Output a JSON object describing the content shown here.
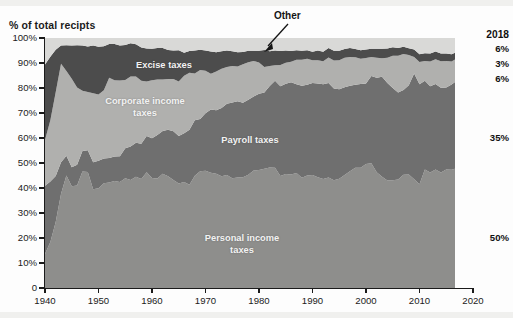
{
  "axis": {
    "ylabel": "% of total recipts",
    "yticks": [
      "0",
      "10%",
      "20%",
      "30%",
      "40%",
      "50%",
      "60%",
      "70%",
      "80%",
      "90%",
      "100%"
    ],
    "xticks": [
      "1940",
      "1950",
      "1960",
      "1970",
      "1980",
      "1990",
      "2000",
      "2010",
      "2020"
    ]
  },
  "annotations": {
    "other_label": "Other",
    "end_year": "2018",
    "end_other": "6%",
    "end_excise": "3%",
    "end_corporate": "6%",
    "end_payroll": "35%",
    "end_personal": "50%"
  },
  "series_labels": {
    "excise": "Excise taxes",
    "corporate_line1": "Corporate income",
    "corporate_line2": "taxes",
    "payroll": "Payroll taxes",
    "personal_line1": "Personal income",
    "personal_line2": "taxes"
  },
  "colors": {
    "other": "#d9d9d7",
    "excise": "#4c4c4c",
    "corporate": "#b0b0ae",
    "payroll": "#6f6f6f",
    "personal": "#8e8e8c",
    "axis": "#1b1b1b",
    "background": "#fdfdfd"
  },
  "chart_data": {
    "type": "area",
    "title": "",
    "subtitle": "",
    "xlabel": "",
    "ylabel": "% of total recipts",
    "stacked": true,
    "normalized": true,
    "grid": false,
    "legend": "in-plot labels",
    "xlim": [
      1940,
      2020
    ],
    "ylim": [
      0,
      100
    ],
    "data_end_year": 2018,
    "x": [
      1940,
      1941,
      1942,
      1943,
      1944,
      1945,
      1946,
      1947,
      1948,
      1949,
      1950,
      1951,
      1952,
      1953,
      1954,
      1955,
      1956,
      1957,
      1958,
      1959,
      1960,
      1961,
      1962,
      1963,
      1964,
      1965,
      1966,
      1967,
      1968,
      1969,
      1970,
      1971,
      1972,
      1973,
      1974,
      1975,
      1976,
      1977,
      1978,
      1979,
      1980,
      1981,
      1982,
      1983,
      1984,
      1985,
      1986,
      1987,
      1988,
      1989,
      1990,
      1991,
      1992,
      1993,
      1994,
      1995,
      1996,
      1997,
      1998,
      1999,
      2000,
      2001,
      2002,
      2003,
      2004,
      2005,
      2006,
      2007,
      2008,
      2009,
      2010,
      2011,
      2012,
      2013,
      2014,
      2015,
      2016,
      2017,
      2018
    ],
    "series": [
      {
        "name": "Personal income taxes",
        "color": "#8e8e8c",
        "values": [
          13.6,
          18.4,
          26.4,
          37.7,
          45.0,
          40.7,
          41.0,
          46.6,
          46.4,
          39.5,
          39.9,
          41.9,
          42.2,
          42.8,
          42.4,
          43.9,
          43.2,
          44.5,
          43.6,
          46.3,
          44.0,
          43.8,
          45.7,
          44.7,
          43.2,
          41.8,
          42.4,
          41.3,
          44.9,
          46.7,
          46.9,
          46.1,
          45.7,
          44.7,
          45.2,
          43.9,
          44.2,
          44.3,
          45.3,
          47.0,
          47.2,
          47.7,
          48.2,
          48.1,
          44.8,
          45.6,
          45.4,
          46.0,
          44.1,
          45.0,
          45.2,
          44.3,
          43.6,
          44.2,
          43.1,
          43.7,
          45.2,
          46.7,
          48.1,
          48.1,
          49.6,
          49.9,
          46.3,
          44.5,
          43.0,
          43.1,
          43.4,
          45.3,
          45.4,
          43.5,
          41.5,
          47.4,
          46.2,
          47.4,
          46.2,
          47.4,
          47.3,
          47.9,
          50.0
        ],
        "end_value": 50
      },
      {
        "name": "Payroll taxes",
        "color": "#6f6f6f",
        "values": [
          27.3,
          24.2,
          18.4,
          12.6,
          7.9,
          7.6,
          8.3,
          8.2,
          8.7,
          10.8,
          11.0,
          9.9,
          9.8,
          9.8,
          10.3,
          12.0,
          13.4,
          13.6,
          14.1,
          14.5,
          15.9,
          17.4,
          17.1,
          18.6,
          19.5,
          19.0,
          19.5,
          22.0,
          22.2,
          20.9,
          23.0,
          25.3,
          25.4,
          27.3,
          28.5,
          30.3,
          30.5,
          29.8,
          30.0,
          29.6,
          30.5,
          30.5,
          32.6,
          34.8,
          35.9,
          36.1,
          36.9,
          35.5,
          36.8,
          36.3,
          36.8,
          37.5,
          37.9,
          37.8,
          36.7,
          35.8,
          35.1,
          34.2,
          33.2,
          33.5,
          32.2,
          34.9,
          37.8,
          40.0,
          39.0,
          36.9,
          34.8,
          33.9,
          35.7,
          42.3,
          40.0,
          35.5,
          34.5,
          34.2,
          33.9,
          32.8,
          34.1,
          35.0,
          35.0
        ],
        "end_value": 35
      },
      {
        "name": "Corporate income taxes",
        "color": "#b0b0ae",
        "values": [
          18.3,
          24.5,
          33.5,
          39.4,
          33.9,
          35.4,
          30.9,
          24.1,
          23.3,
          27.6,
          26.5,
          27.3,
          32.1,
          30.5,
          30.3,
          27.3,
          28.0,
          26.5,
          25.2,
          21.8,
          23.2,
          22.2,
          20.6,
          20.3,
          20.9,
          21.8,
          23.0,
          22.8,
          18.7,
          19.6,
          17.0,
          14.3,
          15.5,
          15.7,
          14.7,
          14.6,
          13.9,
          15.4,
          15.0,
          14.2,
          12.5,
          10.2,
          8.0,
          6.2,
          8.5,
          8.4,
          8.2,
          9.8,
          10.4,
          10.4,
          9.1,
          9.3,
          9.2,
          10.2,
          11.2,
          11.6,
          11.8,
          11.5,
          11.0,
          10.1,
          10.2,
          7.6,
          8.0,
          7.4,
          10.1,
          12.9,
          14.7,
          14.4,
          12.1,
          6.6,
          8.9,
          7.9,
          9.9,
          9.9,
          10.6,
          10.6,
          9.2,
          9.0,
          6.0
        ],
        "end_value": 6
      },
      {
        "name": "Excise taxes",
        "color": "#4c4c4c",
        "values": [
          30.2,
          25.4,
          17.0,
          7.3,
          10.3,
          13.3,
          16.9,
          18.1,
          18.2,
          19.1,
          19.1,
          17.6,
          13.5,
          14.5,
          14.0,
          14.0,
          13.3,
          12.9,
          13.3,
          13.2,
          12.6,
          12.6,
          12.6,
          11.6,
          11.4,
          12.5,
          9.2,
          8.7,
          9.2,
          8.1,
          8.1,
          8.9,
          7.7,
          7.0,
          6.6,
          5.9,
          5.7,
          4.9,
          4.6,
          4.1,
          4.7,
          6.8,
          5.9,
          5.9,
          5.6,
          4.9,
          4.3,
          3.8,
          3.6,
          3.4,
          3.4,
          3.9,
          3.8,
          3.8,
          3.9,
          3.8,
          3.5,
          3.6,
          3.3,
          3.4,
          3.4,
          3.3,
          3.6,
          3.8,
          3.7,
          3.4,
          3.1,
          2.9,
          2.7,
          3.0,
          3.1,
          3.1,
          3.2,
          3.1,
          3.1,
          3.0,
          2.9,
          2.5,
          3.0
        ],
        "end_value": 3
      },
      {
        "name": "Other",
        "color": "#d9d9d7",
        "values": [
          10.6,
          7.5,
          4.7,
          3.0,
          2.9,
          3.0,
          2.9,
          3.0,
          3.4,
          3.0,
          3.5,
          3.3,
          2.4,
          2.4,
          3.0,
          2.8,
          2.1,
          2.5,
          3.8,
          4.2,
          4.3,
          4.0,
          4.0,
          4.8,
          5.0,
          4.9,
          5.9,
          5.2,
          5.0,
          4.7,
          5.0,
          5.4,
          5.7,
          5.3,
          5.0,
          5.3,
          5.7,
          5.6,
          5.1,
          5.1,
          5.1,
          4.8,
          5.3,
          5.0,
          5.2,
          5.0,
          5.2,
          4.9,
          5.1,
          4.9,
          5.5,
          5.0,
          5.5,
          4.0,
          5.1,
          5.1,
          4.4,
          4.0,
          4.4,
          4.9,
          4.6,
          4.3,
          4.3,
          4.3,
          4.2,
          3.7,
          4.0,
          3.5,
          4.1,
          4.6,
          6.5,
          6.1,
          6.2,
          5.4,
          6.2,
          6.2,
          6.5,
          5.6,
          6.0
        ],
        "end_value": 6
      }
    ]
  }
}
